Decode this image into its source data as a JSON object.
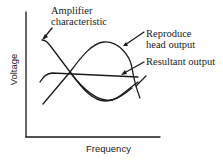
{
  "diagram": {
    "axes": {
      "x_label": "Frequency",
      "y_label": "Voltage"
    },
    "annotations": {
      "amplifier": {
        "line1": "Amplifier",
        "line2": "characteristic"
      },
      "reproduce": {
        "line1": "Reproduce",
        "line2": "head output"
      },
      "resultant": {
        "line1": "Resultant output"
      }
    },
    "curves": [
      {
        "name": "Amplifier characteristic",
        "shape": "falling with frequency"
      },
      {
        "name": "Reproduce head output",
        "shape": "rising then falling hump"
      },
      {
        "name": "Resultant output",
        "shape": "flat"
      }
    ],
    "colors": {
      "line": "#1a1a1a",
      "background": "#ffffff"
    }
  }
}
